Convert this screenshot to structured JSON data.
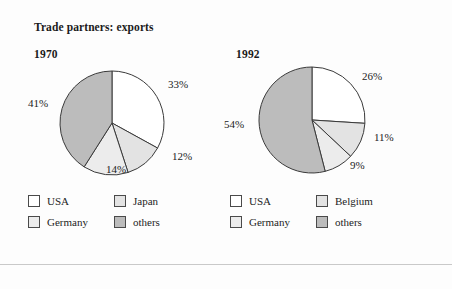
{
  "figure": {
    "title": "Trade partners: exports",
    "background_color": "#fdfdfd",
    "rule_color": "#c9c9c9"
  },
  "palette": {
    "usa": "#ffffff",
    "japan": "#e3e3e3",
    "belgium": "#e3e3e3",
    "germany": "#ececec",
    "others": "#bcbcbc",
    "outline": "#3a3a3a",
    "text": "#1d1d1d"
  },
  "panels": [
    {
      "year": "1970",
      "pct_labels": [
        {
          "text": "33%",
          "left": "148px",
          "top": "78px"
        },
        {
          "text": "12%",
          "left": "152px",
          "top": "150px"
        },
        {
          "text": "14%",
          "left": "86px",
          "top": "163px"
        },
        {
          "text": "41%",
          "left": "8px",
          "top": "97px"
        }
      ],
      "legend": [
        {
          "label": "USA",
          "color": "#ffffff"
        },
        {
          "label": "Japan",
          "color": "#e3e3e3"
        },
        {
          "label": "Germany",
          "color": "#ececec"
        },
        {
          "label": "others",
          "color": "#bcbcbc"
        }
      ]
    },
    {
      "year": "1992",
      "pct_labels": [
        {
          "text": "26%",
          "left": "140px",
          "top": "70px"
        },
        {
          "text": "11%",
          "left": "152px",
          "top": "131px"
        },
        {
          "text": "9%",
          "left": "128px",
          "top": "159px"
        },
        {
          "text": "54%",
          "left": "2px",
          "top": "118px"
        }
      ],
      "legend": [
        {
          "label": "USA",
          "color": "#ffffff"
        },
        {
          "label": "Belgium",
          "color": "#e3e3e3"
        },
        {
          "label": "Germany",
          "color": "#ececec"
        },
        {
          "label": "others",
          "color": "#bcbcbc"
        }
      ]
    }
  ],
  "chart_data": [
    {
      "type": "pie",
      "title": "Trade partners: exports",
      "subtitle": "1970",
      "categories": [
        "USA",
        "Japan",
        "Germany",
        "others"
      ],
      "values": [
        33,
        12,
        14,
        41
      ],
      "labels": [
        "33%",
        "12%",
        "14%",
        "41%"
      ],
      "colors": [
        "#ffffff",
        "#e3e3e3",
        "#ececec",
        "#bcbcbc"
      ],
      "start_angle_deg": 0,
      "direction": "clockwise",
      "legend_position": "below",
      "legend_order": [
        "USA",
        "Japan",
        "Germany",
        "others"
      ],
      "units": "percent"
    },
    {
      "type": "pie",
      "title": "Trade partners: exports",
      "subtitle": "1992",
      "categories": [
        "USA",
        "Belgium",
        "Germany",
        "others"
      ],
      "values": [
        26,
        11,
        9,
        54
      ],
      "labels": [
        "26%",
        "11%",
        "9%",
        "54%"
      ],
      "colors": [
        "#ffffff",
        "#e3e3e3",
        "#ececec",
        "#bcbcbc"
      ],
      "start_angle_deg": 0,
      "direction": "clockwise",
      "legend_position": "below",
      "legend_order": [
        "USA",
        "Belgium",
        "Germany",
        "others"
      ],
      "units": "percent"
    }
  ]
}
